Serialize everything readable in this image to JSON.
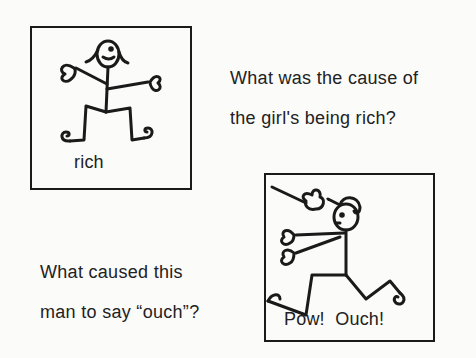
{
  "panels": [
    {
      "id": "rich-panel",
      "figure": "girl-stick-figure",
      "caption": "rich",
      "question_lines": [
        "What was the cause of",
        "the girl's being rich?"
      ]
    },
    {
      "id": "ouch-panel",
      "figure": "man-being-hit-stick-figure",
      "caption": "Pow!  Ouch!",
      "question_lines": [
        "What caused this",
        "man to say “ouch”?"
      ]
    }
  ],
  "colors": {
    "ink": "#1a1a1a",
    "paper": "#fbfbfa"
  }
}
